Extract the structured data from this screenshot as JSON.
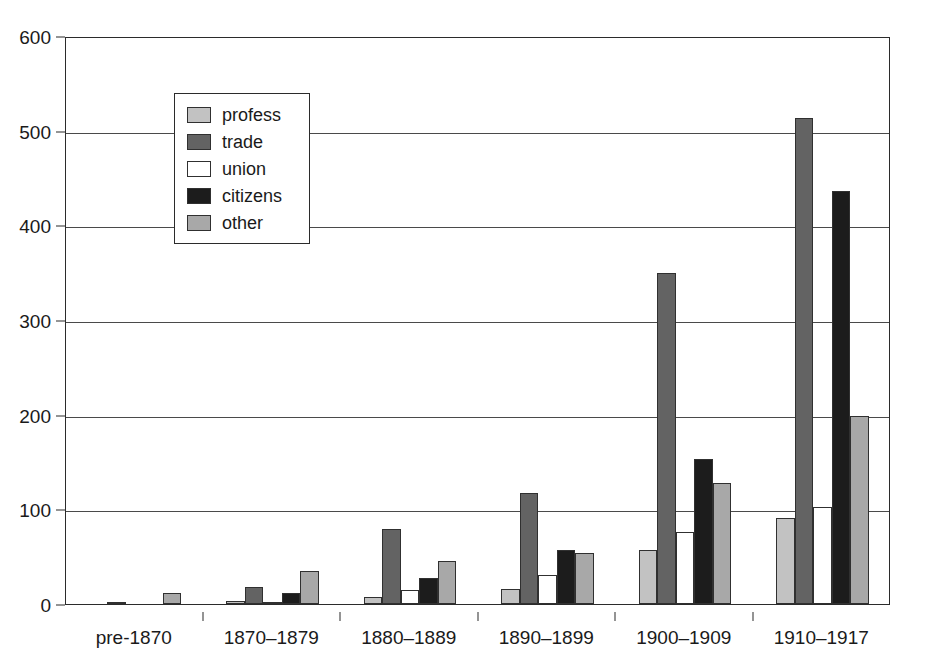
{
  "chart_data": {
    "type": "bar",
    "title": "",
    "subtitle": "",
    "xlabel": "",
    "ylabel": "",
    "ylim": [
      0,
      600
    ],
    "yticks": [
      0,
      100,
      200,
      300,
      400,
      500,
      600
    ],
    "ytick_labels": [
      "0",
      "100",
      "200",
      "300",
      "400",
      "500",
      "600"
    ],
    "grid": true,
    "grid_axis": "y",
    "legend_position": "upper-left-inside",
    "categories": [
      "pre-1870",
      "1870–1879",
      "1880–1889",
      "1890–1899",
      "1900–1909",
      "1910–1917"
    ],
    "series": [
      {
        "name": "profess",
        "color": "#c2c2c2",
        "values": [
          0,
          3,
          7,
          16,
          57,
          91
        ]
      },
      {
        "name": "trade",
        "color": "#636363",
        "values": [
          2,
          18,
          79,
          117,
          350,
          513
        ]
      },
      {
        "name": "union",
        "color": "#ffffff",
        "values": [
          0,
          1,
          15,
          31,
          76,
          102
        ]
      },
      {
        "name": "citizens",
        "color": "#1c1c1c",
        "values": [
          0,
          12,
          28,
          57,
          153,
          436
        ]
      },
      {
        "name": "other",
        "color": "#a8a8a8",
        "values": [
          12,
          35,
          45,
          54,
          128,
          199
        ]
      }
    ]
  },
  "legend": {
    "items": [
      {
        "label": "profess"
      },
      {
        "label": "trade"
      },
      {
        "label": "union"
      },
      {
        "label": "citizens"
      },
      {
        "label": "other"
      }
    ]
  },
  "colors": {
    "axis": "#2b2b2b",
    "grid": "#4a4a4a",
    "text": "#1a1a1a",
    "background": "#ffffff",
    "bar_outline": "#303030"
  }
}
